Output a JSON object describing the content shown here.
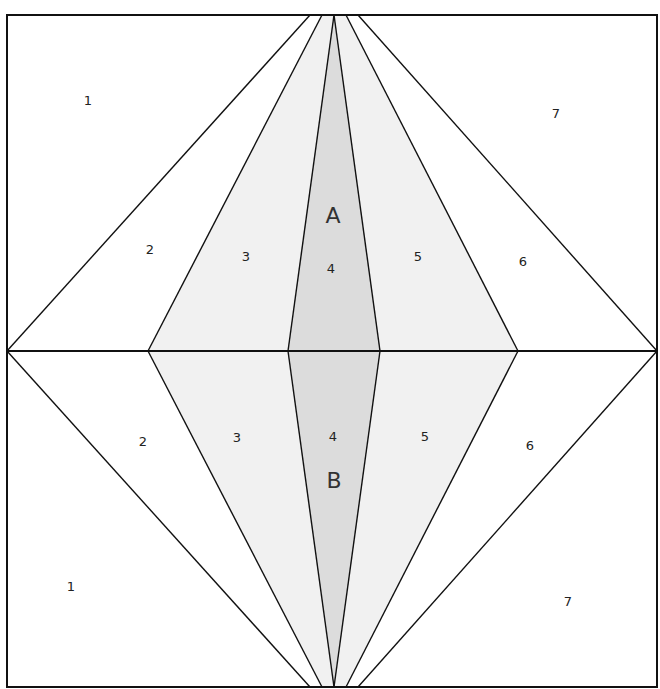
{
  "diagram": {
    "type": "paper-piecing-pattern",
    "sections": [
      {
        "name": "A",
        "pieces": [
          {
            "id": "1",
            "label": "1",
            "shade": "white"
          },
          {
            "id": "2",
            "label": "2",
            "shade": "white"
          },
          {
            "id": "3",
            "label": "3",
            "shade": "light"
          },
          {
            "id": "4",
            "label": "4",
            "shade": "medium"
          },
          {
            "id": "5",
            "label": "5",
            "shade": "light"
          },
          {
            "id": "6",
            "label": "6",
            "shade": "white"
          },
          {
            "id": "7",
            "label": "7",
            "shade": "white"
          }
        ]
      },
      {
        "name": "B",
        "pieces": [
          {
            "id": "1",
            "label": "1",
            "shade": "white"
          },
          {
            "id": "2",
            "label": "2",
            "shade": "white"
          },
          {
            "id": "3",
            "label": "3",
            "shade": "light"
          },
          {
            "id": "4",
            "label": "4",
            "shade": "medium"
          },
          {
            "id": "5",
            "label": "5",
            "shade": "light"
          },
          {
            "id": "6",
            "label": "6",
            "shade": "white"
          },
          {
            "id": "7",
            "label": "7",
            "shade": "white"
          }
        ]
      }
    ],
    "colors": {
      "white": "#ffffff",
      "light": "#f1f1f1",
      "medium": "#dcdcdc",
      "line": "#111111"
    }
  }
}
